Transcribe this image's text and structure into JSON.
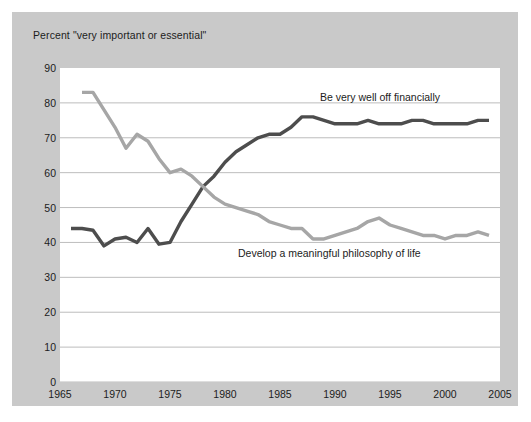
{
  "figure": {
    "background_color": "#c9c9c9",
    "plot_background_color": "#ffffff",
    "axis_title": "Percent \"very important or essential\""
  },
  "labels": {
    "financial": "Be very well off financially",
    "philosophy": "Develop a meaningful philosophy of life"
  },
  "chart_data": {
    "type": "line",
    "title": "",
    "subtitle": "",
    "xlabel": "",
    "ylabel": "Percent \"very important or essential\"",
    "xlim": [
      1965,
      2005
    ],
    "ylim": [
      0,
      90
    ],
    "xticks": [
      "1965",
      "1970",
      "1975",
      "1980",
      "1985",
      "1990",
      "1995",
      "2000",
      "2005"
    ],
    "yticks": [
      "0",
      "10",
      "20",
      "30",
      "40",
      "50",
      "60",
      "70",
      "80",
      "90"
    ],
    "grid": "horizontal",
    "legend": "inline-annotations",
    "series": [
      {
        "name": "Be very well off financially",
        "color": "#4d4d4d",
        "x": [
          1966,
          1967,
          1968,
          1969,
          1970,
          1971,
          1972,
          1973,
          1974,
          1975,
          1976,
          1977,
          1978,
          1979,
          1980,
          1981,
          1982,
          1983,
          1984,
          1985,
          1986,
          1987,
          1988,
          1989,
          1990,
          1991,
          1992,
          1993,
          1994,
          1995,
          1996,
          1997,
          1998,
          1999,
          2000,
          2001,
          2002,
          2003,
          2004
        ],
        "values": [
          44,
          44,
          43.5,
          39,
          41,
          41.5,
          40,
          44,
          39.5,
          40,
          46,
          51,
          56,
          59,
          63,
          66,
          68,
          70,
          71,
          71,
          73,
          76,
          76,
          75,
          74,
          74,
          74,
          75,
          74,
          74,
          74,
          75,
          75,
          74,
          74,
          74,
          74,
          75,
          75
        ]
      },
      {
        "name": "Develop a meaningful philosophy of life",
        "color": "#a6a6a6",
        "x": [
          1967,
          1968,
          1969,
          1970,
          1971,
          1972,
          1973,
          1974,
          1975,
          1976,
          1977,
          1978,
          1979,
          1980,
          1981,
          1982,
          1983,
          1984,
          1985,
          1986,
          1987,
          1988,
          1989,
          1990,
          1991,
          1992,
          1993,
          1994,
          1995,
          1996,
          1997,
          1998,
          1999,
          2000,
          2001,
          2002,
          2003,
          2004
        ],
        "values": [
          83,
          83,
          78,
          73,
          67,
          71,
          69,
          64,
          60,
          61,
          59,
          56,
          53,
          51,
          50,
          49,
          48,
          46,
          45,
          44,
          44,
          41,
          41,
          42,
          43,
          44,
          46,
          47,
          45,
          44,
          43,
          42,
          42,
          41,
          42,
          42,
          43,
          42
        ]
      }
    ]
  }
}
